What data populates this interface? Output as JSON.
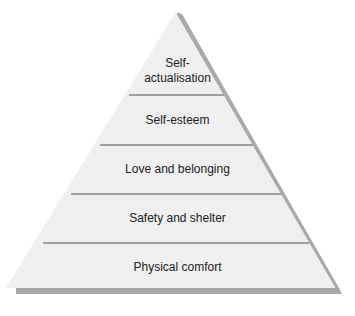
{
  "diagram": {
    "type": "pyramid",
    "fill_color": "#efefef",
    "shadow_color": "#a9a9a9",
    "divider_color": "#a0a0a0",
    "levels": [
      {
        "label": "Self-\nactualisation",
        "line1": "Self-",
        "line2": "actualisation"
      },
      {
        "label": "Self-esteem"
      },
      {
        "label": "Love and belonging"
      },
      {
        "label": "Safety and shelter"
      },
      {
        "label": "Physical comfort"
      }
    ]
  }
}
